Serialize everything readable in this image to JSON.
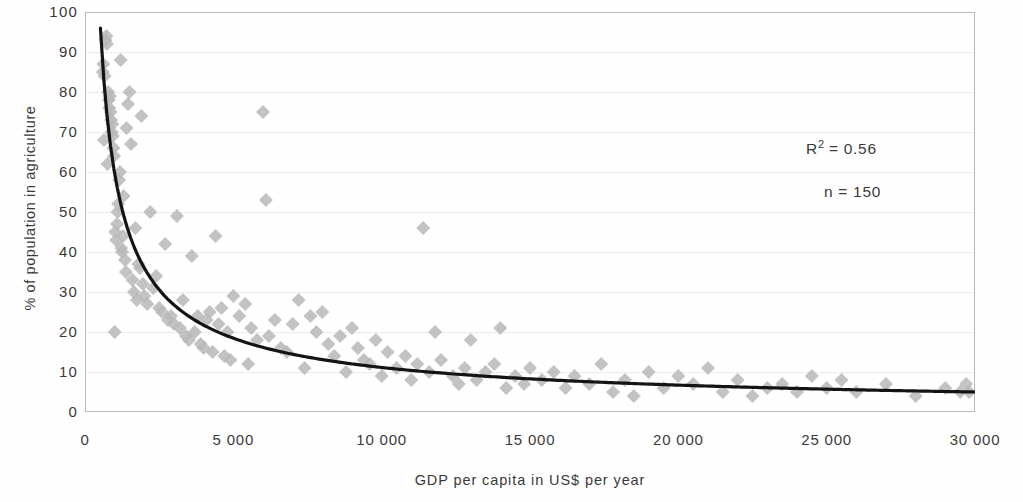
{
  "chart_data": {
    "type": "scatter",
    "title": "",
    "xlabel": "GDP per capita in US$ per year",
    "ylabel": "% of population in agriculture",
    "xlim": [
      0,
      30000
    ],
    "ylim": [
      0,
      100
    ],
    "xticks": [
      0,
      5000,
      10000,
      15000,
      20000,
      25000,
      30000
    ],
    "xticklabels": [
      "0",
      "5 000",
      "10 000",
      "15 000",
      "20 000",
      "25 000",
      "30 000"
    ],
    "yticks": [
      0,
      10,
      20,
      30,
      40,
      50,
      60,
      70,
      80,
      90,
      100
    ],
    "yticklabels": [
      "0",
      "10",
      "20",
      "30",
      "40",
      "50",
      "60",
      "70",
      "80",
      "90",
      "100"
    ],
    "grid": "horizontal-faint",
    "legend": "none",
    "marker": "diamond",
    "marker_color": "#b8b8b8",
    "marker_size": 7,
    "trendline": {
      "visible": true,
      "color": "#141414",
      "width": 3.2,
      "type": "power",
      "description": "fitted decreasing power curve from ~96% near GDP 500 down to ~5% at GDP 30 000"
    },
    "annotations": [
      {
        "name": "r-squared",
        "text": "R² = 0.56",
        "base": "R",
        "sup": "2",
        "rest": " = 0.56"
      },
      {
        "name": "sample-size",
        "text": "n = 150"
      }
    ],
    "series": [
      {
        "name": "countries",
        "n": 150,
        "points": [
          [
            600,
            85
          ],
          [
            620,
            87
          ],
          [
            640,
            68
          ],
          [
            660,
            84
          ],
          [
            700,
            93
          ],
          [
            720,
            94
          ],
          [
            740,
            92
          ],
          [
            760,
            62
          ],
          [
            780,
            80
          ],
          [
            800,
            78
          ],
          [
            820,
            76
          ],
          [
            840,
            79
          ],
          [
            860,
            75
          ],
          [
            880,
            73
          ],
          [
            900,
            70
          ],
          [
            920,
            72
          ],
          [
            940,
            69
          ],
          [
            960,
            66
          ],
          [
            980,
            64
          ],
          [
            1000,
            20
          ],
          [
            1020,
            45
          ],
          [
            1050,
            43
          ],
          [
            1080,
            47
          ],
          [
            1100,
            50
          ],
          [
            1120,
            52
          ],
          [
            1150,
            58
          ],
          [
            1180,
            60
          ],
          [
            1200,
            88
          ],
          [
            1220,
            41
          ],
          [
            1250,
            40
          ],
          [
            1280,
            44
          ],
          [
            1300,
            54
          ],
          [
            1350,
            38
          ],
          [
            1380,
            35
          ],
          [
            1400,
            71
          ],
          [
            1450,
            77
          ],
          [
            1500,
            80
          ],
          [
            1550,
            67
          ],
          [
            1600,
            33
          ],
          [
            1650,
            30
          ],
          [
            1700,
            46
          ],
          [
            1750,
            28
          ],
          [
            1800,
            37
          ],
          [
            1850,
            36
          ],
          [
            1900,
            74
          ],
          [
            1950,
            32
          ],
          [
            2000,
            29
          ],
          [
            2100,
            27
          ],
          [
            2200,
            50
          ],
          [
            2300,
            31
          ],
          [
            2400,
            34
          ],
          [
            2500,
            26
          ],
          [
            2600,
            25
          ],
          [
            2700,
            42
          ],
          [
            2800,
            23
          ],
          [
            2900,
            24
          ],
          [
            3000,
            22
          ],
          [
            3100,
            49
          ],
          [
            3200,
            21
          ],
          [
            3300,
            28
          ],
          [
            3400,
            19
          ],
          [
            3500,
            18
          ],
          [
            3600,
            39
          ],
          [
            3700,
            20
          ],
          [
            3800,
            24
          ],
          [
            3900,
            17
          ],
          [
            4000,
            16
          ],
          [
            4100,
            23
          ],
          [
            4200,
            25
          ],
          [
            4300,
            15
          ],
          [
            4400,
            44
          ],
          [
            4500,
            22
          ],
          [
            4600,
            26
          ],
          [
            4700,
            14
          ],
          [
            4800,
            20
          ],
          [
            4900,
            13
          ],
          [
            5000,
            29
          ],
          [
            5200,
            24
          ],
          [
            5400,
            27
          ],
          [
            5500,
            12
          ],
          [
            5600,
            21
          ],
          [
            5800,
            18
          ],
          [
            6000,
            75
          ],
          [
            6100,
            53
          ],
          [
            6200,
            19
          ],
          [
            6400,
            23
          ],
          [
            6600,
            16
          ],
          [
            6800,
            15
          ],
          [
            7000,
            22
          ],
          [
            7200,
            28
          ],
          [
            7400,
            11
          ],
          [
            7600,
            24
          ],
          [
            7800,
            20
          ],
          [
            8000,
            25
          ],
          [
            8200,
            17
          ],
          [
            8400,
            14
          ],
          [
            8600,
            19
          ],
          [
            8800,
            10
          ],
          [
            9000,
            21
          ],
          [
            9200,
            16
          ],
          [
            9400,
            13
          ],
          [
            9600,
            12
          ],
          [
            9800,
            18
          ],
          [
            10000,
            9
          ],
          [
            10200,
            15
          ],
          [
            10500,
            11
          ],
          [
            10800,
            14
          ],
          [
            11000,
            8
          ],
          [
            11200,
            12
          ],
          [
            11400,
            46
          ],
          [
            11600,
            10
          ],
          [
            11800,
            20
          ],
          [
            12000,
            13
          ],
          [
            12400,
            9
          ],
          [
            12600,
            7
          ],
          [
            12800,
            11
          ],
          [
            13000,
            18
          ],
          [
            13200,
            8
          ],
          [
            13500,
            10
          ],
          [
            13800,
            12
          ],
          [
            14000,
            21
          ],
          [
            14200,
            6
          ],
          [
            14500,
            9
          ],
          [
            14800,
            7
          ],
          [
            15000,
            11
          ],
          [
            15400,
            8
          ],
          [
            15800,
            10
          ],
          [
            16200,
            6
          ],
          [
            16500,
            9
          ],
          [
            17000,
            7
          ],
          [
            17400,
            12
          ],
          [
            17800,
            5
          ],
          [
            18200,
            8
          ],
          [
            18500,
            4
          ],
          [
            19000,
            10
          ],
          [
            19500,
            6
          ],
          [
            20000,
            9
          ],
          [
            20500,
            7
          ],
          [
            21000,
            11
          ],
          [
            21500,
            5
          ],
          [
            22000,
            8
          ],
          [
            22500,
            4
          ],
          [
            23000,
            6
          ],
          [
            23500,
            7
          ],
          [
            24000,
            5
          ],
          [
            24500,
            9
          ],
          [
            25000,
            6
          ],
          [
            25500,
            8
          ],
          [
            26000,
            5
          ],
          [
            27000,
            7
          ],
          [
            28000,
            4
          ],
          [
            29000,
            6
          ],
          [
            29500,
            5
          ],
          [
            29700,
            7
          ],
          [
            29800,
            5
          ]
        ]
      }
    ]
  }
}
